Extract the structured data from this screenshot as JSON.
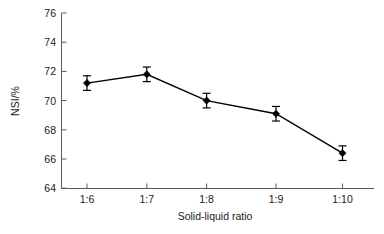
{
  "chart_data": {
    "type": "line",
    "title": "",
    "xlabel": "Solid-liquid ratio",
    "ylabel": "NSI/%",
    "categories": [
      "1:6",
      "1:7",
      "1:8",
      "1:9",
      "1:10"
    ],
    "values": [
      71.2,
      71.8,
      70.0,
      69.1,
      66.4
    ],
    "errors": [
      0.5,
      0.5,
      0.5,
      0.5,
      0.5
    ],
    "error_type": "symmetric",
    "ylim": [
      64,
      76
    ],
    "yticks": [
      64,
      66,
      68,
      70,
      72,
      74,
      76
    ],
    "ytick_labels": [
      "64",
      "66",
      "68",
      "70",
      "72",
      "74",
      "76"
    ],
    "xtick_labels": [
      "1:6",
      "1:7",
      "1:8",
      "1:9",
      "1:10"
    ],
    "grid": false,
    "legend": false,
    "marker": "diamond",
    "marker_color": "#000000",
    "line_color": "#000000",
    "series": [
      {
        "name": "NSI",
        "values": [
          71.2,
          71.8,
          70.0,
          69.1,
          66.4
        ],
        "errors": [
          0.5,
          0.5,
          0.5,
          0.5,
          0.5
        ]
      }
    ]
  },
  "axes": {
    "y_label": "NSI/%",
    "x_label": "Solid-liquid ratio"
  }
}
